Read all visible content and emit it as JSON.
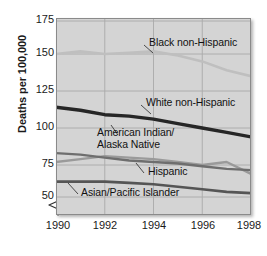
{
  "chart_data": {
    "type": "line",
    "title": "",
    "subtitle": "",
    "xlabel": "",
    "ylabel": "Deaths per 100,000",
    "x": [
      1990,
      1991,
      1992,
      1993,
      1994,
      1995,
      1996,
      1997,
      1998
    ],
    "xlim": [
      1990,
      1998
    ],
    "ylim": [
      40,
      175
    ],
    "y_axis_break": true,
    "y_axis_break_note": "axis broken below 50",
    "xticks": [
      1990,
      1992,
      1994,
      1996,
      1998
    ],
    "xtick_labels": [
      "1990",
      "1992",
      "1994",
      "1996",
      "1998"
    ],
    "yticks": [
      50,
      75,
      100,
      125,
      150,
      175
    ],
    "ytick_labels": [
      "50",
      "75",
      "100",
      "125",
      "150",
      "175"
    ],
    "grid": true,
    "grid_axis": "both",
    "legend": "inline-annotations",
    "plot_background": "#d4d4d4",
    "series": [
      {
        "name": "Black non-Hispanic",
        "color": "#bfbfbf",
        "width": 2.6,
        "values": [
          150,
          152,
          150,
          151,
          152,
          149,
          145,
          139,
          135
        ],
        "label_x": 150,
        "label_y": 36
      },
      {
        "name": "White non-Hispanic",
        "color": "#262626",
        "width": 3.4,
        "values": [
          114,
          112,
          109,
          108,
          106,
          103,
          100,
          97,
          94
        ],
        "label_x": 147,
        "label_y": 96
      },
      {
        "name": "American Indian/\nAlaska Native",
        "color": "#9a9a9a",
        "width": 2.4,
        "values": [
          77,
          79,
          81,
          80,
          79,
          77,
          75,
          77,
          68
        ],
        "label_x": 98,
        "label_y": 124
      },
      {
        "name": "Hispanic",
        "color": "#6e6e6e",
        "width": 2.4,
        "values": [
          83,
          82,
          80,
          78,
          77,
          76,
          74,
          72,
          71
        ],
        "label_x": 142,
        "label_y": 164
      },
      {
        "name": "Asian/Pacific Islander",
        "color": "#555555",
        "width": 2.6,
        "values": [
          62,
          62,
          62,
          61,
          60,
          58,
          56,
          54,
          53
        ],
        "label_x": 75,
        "label_y": 187
      }
    ]
  },
  "axis": {
    "y_title": "Deaths per 100,000",
    "y_tick_0": "50",
    "y_tick_1": "75",
    "y_tick_2": "100",
    "y_tick_3": "125",
    "y_tick_4": "150",
    "y_tick_5": "175",
    "x_tick_0": "1990",
    "x_tick_1": "1992",
    "x_tick_2": "1994",
    "x_tick_3": "1996",
    "x_tick_4": "1998"
  },
  "labels": {
    "black_non_hispanic": "Black non-Hispanic",
    "white_non_hispanic": "White non-Hispanic",
    "american_indian_line1": "American Indian/",
    "american_indian_line2": "Alaska Native",
    "hispanic": "Hispanic",
    "asian_pacific_islander": "Asian/Pacific Islander"
  }
}
